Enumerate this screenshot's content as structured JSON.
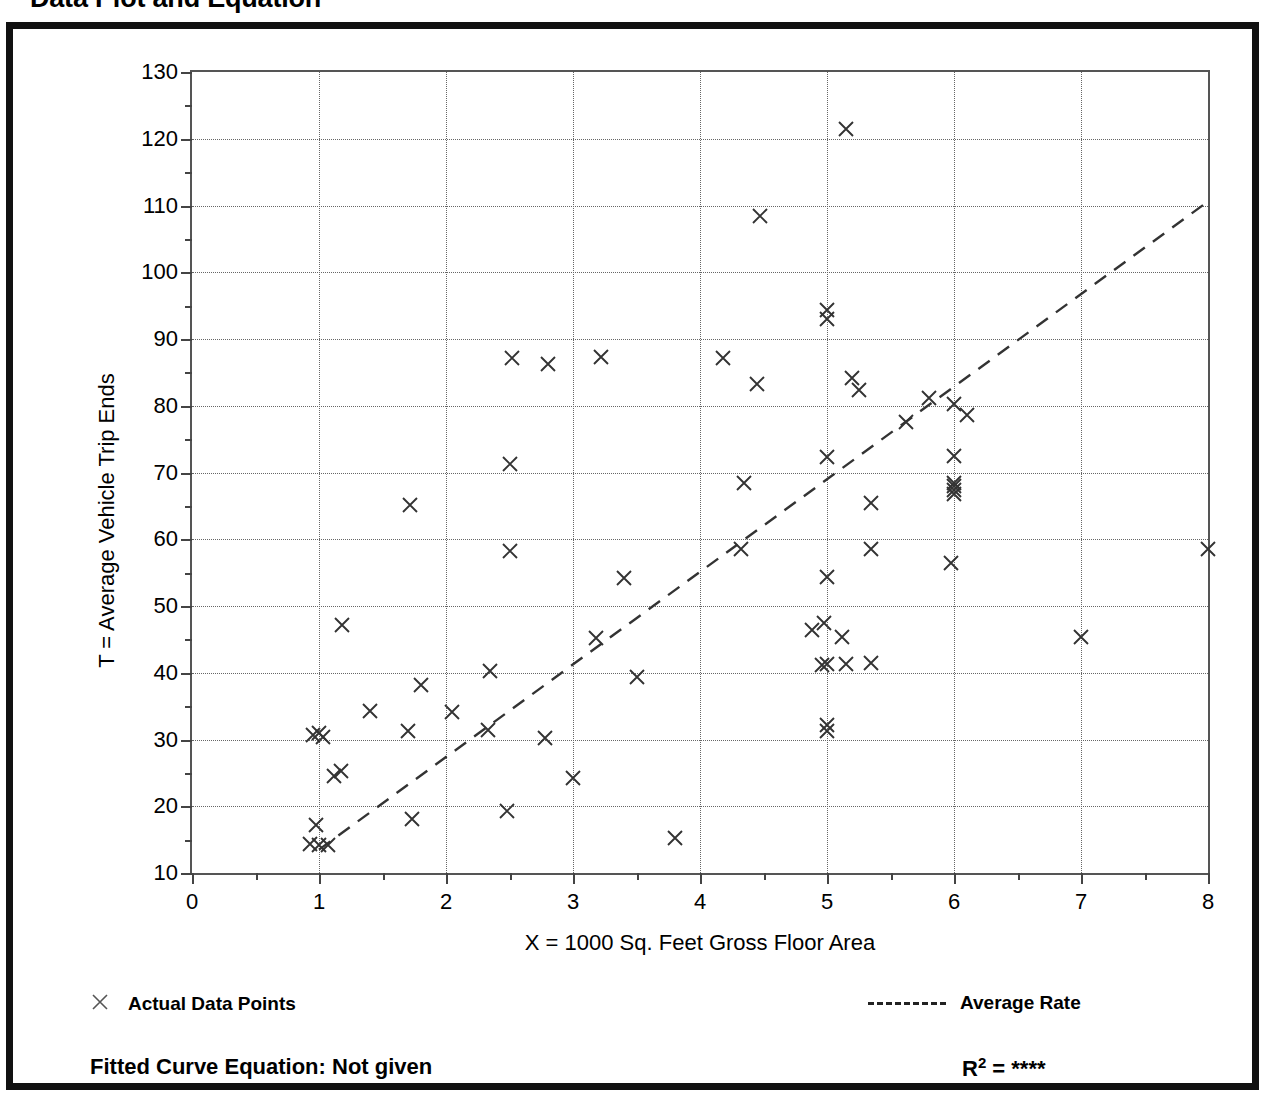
{
  "page_title": "Data Plot and Equation",
  "axes": {
    "y_title": "T = Average Vehicle Trip Ends",
    "x_title": "X = 1000 Sq. Feet Gross Floor Area"
  },
  "legend": {
    "points_marker": "x-marker-icon",
    "points_label": "Actual Data Points",
    "rate_line": "dashed-line-icon",
    "rate_label": "Average Rate"
  },
  "footer": {
    "fitted_label": "Fitted Curve Equation:  Not given",
    "r_symbol": "R",
    "r_exponent": "2",
    "r_equals": " = ",
    "r_value": "****"
  },
  "chart_data": {
    "type": "scatter",
    "title": "Data Plot and Equation",
    "xlabel": "X = 1000 Sq. Feet Gross Floor Area",
    "ylabel": "T = Average Vehicle Trip Ends",
    "xlim": [
      0,
      8
    ],
    "ylim": [
      10,
      130
    ],
    "xticks": [
      0,
      1,
      2,
      3,
      4,
      5,
      6,
      7,
      8
    ],
    "yticks": [
      10,
      20,
      30,
      40,
      50,
      60,
      70,
      80,
      90,
      100,
      110,
      120,
      130
    ],
    "x_minor_step": 0.5,
    "y_minor_step": 5,
    "grid": true,
    "grid_style": "dotted",
    "legend_position": "below-plot",
    "marker": "x",
    "marker_color": "#333333",
    "series": [
      {
        "name": "Actual Data Points",
        "points": [
          [
            0.93,
            14.3
          ],
          [
            1.0,
            14.2
          ],
          [
            1.07,
            14.2
          ],
          [
            0.98,
            17.2
          ],
          [
            1.12,
            24.6
          ],
          [
            1.17,
            25.3
          ],
          [
            0.95,
            30.6
          ],
          [
            1.0,
            30.9
          ],
          [
            1.03,
            30.4
          ],
          [
            1.18,
            47.1
          ],
          [
            1.4,
            34.2
          ],
          [
            1.7,
            31.3
          ],
          [
            1.73,
            18.1
          ],
          [
            1.72,
            65.2
          ],
          [
            1.8,
            38.2
          ],
          [
            2.05,
            34.1
          ],
          [
            2.33,
            31.4
          ],
          [
            2.35,
            40.3
          ],
          [
            2.48,
            19.3
          ],
          [
            2.5,
            58.3
          ],
          [
            2.5,
            71.2
          ],
          [
            2.52,
            87.2
          ],
          [
            2.78,
            30.2
          ],
          [
            2.8,
            86.3
          ],
          [
            3.0,
            24.2
          ],
          [
            3.18,
            45.2
          ],
          [
            3.22,
            87.3
          ],
          [
            3.4,
            54.2
          ],
          [
            3.5,
            39.4
          ],
          [
            3.8,
            15.3
          ],
          [
            4.18,
            87.2
          ],
          [
            4.32,
            58.6
          ],
          [
            4.35,
            68.4
          ],
          [
            4.45,
            83.3
          ],
          [
            4.47,
            108.4
          ],
          [
            4.88,
            46.4
          ],
          [
            4.96,
            41.2
          ],
          [
            4.98,
            47.4
          ],
          [
            5.0,
            31.3
          ],
          [
            5.0,
            32.2
          ],
          [
            5.0,
            41.3
          ],
          [
            5.0,
            54.3
          ],
          [
            5.0,
            72.3
          ],
          [
            5.0,
            93.0
          ],
          [
            5.0,
            94.3
          ],
          [
            5.12,
            45.4
          ],
          [
            5.15,
            41.3
          ],
          [
            5.15,
            121.5
          ],
          [
            5.2,
            84.2
          ],
          [
            5.25,
            82.4
          ],
          [
            5.35,
            41.4
          ],
          [
            5.35,
            58.5
          ],
          [
            5.35,
            65.4
          ],
          [
            5.62,
            77.5
          ],
          [
            5.8,
            81.2
          ],
          [
            5.98,
            56.4
          ],
          [
            6.0,
            66.8
          ],
          [
            6.0,
            67.4
          ],
          [
            6.0,
            68.0
          ],
          [
            6.0,
            68.5
          ],
          [
            6.0,
            72.4
          ],
          [
            6.0,
            80.3
          ],
          [
            6.1,
            78.6
          ],
          [
            7.0,
            45.4
          ],
          [
            8.0,
            58.5
          ]
        ]
      }
    ],
    "trend_line": {
      "name": "Average Rate",
      "style": "dashed",
      "x_start": 1.0,
      "y_start": 13.5,
      "x_end": 8.0,
      "y_end": 110.6
    }
  }
}
